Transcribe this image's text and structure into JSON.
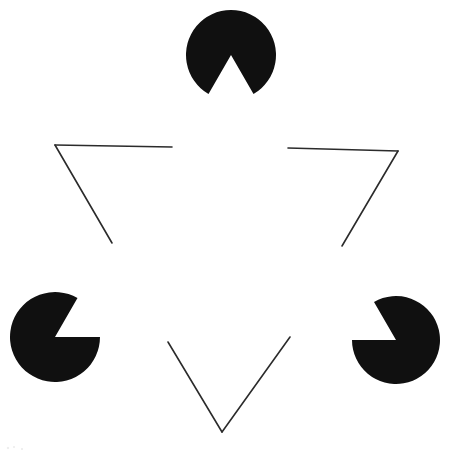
{
  "figure": {
    "canvas": {
      "width": 455,
      "height": 457
    },
    "colors": {
      "background": "#ffffff",
      "disc_fill": "#101010",
      "outline_stroke": "#2b2b2b"
    },
    "stroke_width": 1.6,
    "inducers": [
      {
        "name": "top-pacman",
        "label": "Top pac-man disc",
        "cx": 231,
        "cy": 55,
        "r": 45,
        "wedge_start_deg": 60,
        "wedge_end_deg": 120,
        "notch_direction": "down"
      },
      {
        "name": "bottom-left-pacman",
        "label": "Bottom-left pac-man disc",
        "cx": 55,
        "cy": 337,
        "r": 45,
        "wedge_start_deg": -60,
        "wedge_end_deg": 0,
        "notch_direction": "upper-right"
      },
      {
        "name": "bottom-right-pacman",
        "label": "Bottom-right pac-man disc",
        "cx": 396,
        "cy": 340,
        "r": 44,
        "wedge_start_deg": 180,
        "wedge_end_deg": 240,
        "notch_direction": "upper-left"
      }
    ],
    "outline_segments": [
      {
        "name": "top-left-horizontal",
        "x1": 55,
        "y1": 145,
        "x2": 172,
        "y2": 147
      },
      {
        "name": "top-right-horizontal",
        "x1": 288,
        "y1": 148,
        "x2": 398,
        "y2": 151
      },
      {
        "name": "left-diagonal",
        "x1": 55,
        "y1": 145,
        "x2": 112,
        "y2": 243
      },
      {
        "name": "bottom-left-diagonal",
        "x1": 168,
        "y1": 342,
        "x2": 222,
        "y2": 432
      },
      {
        "name": "right-diagonal",
        "x1": 398,
        "y1": 151,
        "x2": 342,
        "y2": 246
      },
      {
        "name": "bottom-right-diagonal",
        "x1": 290,
        "y1": 337,
        "x2": 222,
        "y2": 432
      }
    ]
  }
}
